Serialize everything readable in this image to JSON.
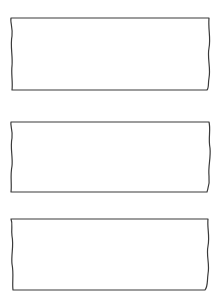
{
  "figure": {
    "type": "patent-style line drawing",
    "background_color": "#ffffff",
    "stroke_color": "#3a3a3a",
    "panels": [
      {
        "id": 1,
        "top": 18,
        "bottom": 90,
        "left": 11,
        "right": 209,
        "edge_style": "wavy-break"
      },
      {
        "id": 2,
        "top": 122,
        "bottom": 192,
        "left": 11,
        "right": 209,
        "edge_style": "wavy-break"
      },
      {
        "id": 3,
        "top": 219,
        "bottom": 290,
        "left": 12,
        "right": 208,
        "edge_style": "wavy-break"
      }
    ]
  }
}
